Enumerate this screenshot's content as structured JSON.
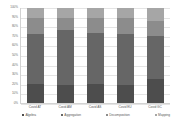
{
  "chart_data": {
    "type": "bar",
    "title": "",
    "subtitle": "",
    "xlabel": "",
    "ylabel": "",
    "stacked": true,
    "percent_stacked": true,
    "grid": true,
    "legend_position": "bottom",
    "ylim": [
      0,
      100
    ],
    "ytick_labels": [
      "100%",
      "90%",
      "80%",
      "70%",
      "60%",
      "50%",
      "40%",
      "30%",
      "20%",
      "10%",
      "0%"
    ],
    "ytick_values": [
      100,
      90,
      80,
      70,
      60,
      50,
      40,
      30,
      20,
      10,
      0
    ],
    "categories": [
      "Covid AT",
      "Covid AM",
      "Covid AS",
      "Covid EU",
      "Covid GC"
    ],
    "series": [
      {
        "name": "Algebra",
        "color": "#4d4d4d",
        "values": [
          20,
          19,
          20,
          19,
          25
        ]
      },
      {
        "name": "Aggregation",
        "color": "#666666",
        "values": [
          53,
          58,
          54,
          54,
          45
        ]
      },
      {
        "name": "Decomposition",
        "color": "#8c8c8c",
        "values": [
          16,
          13,
          15,
          16,
          16
        ]
      },
      {
        "name": "Mapping",
        "color": "#a6a6a6",
        "values": [
          11,
          10,
          11,
          11,
          14
        ]
      }
    ]
  },
  "colors": {
    "background": "#ffffff",
    "grid": "#e4e4e4",
    "axis": "#d2d2d2",
    "tick_text": "#6d6d6d",
    "label_text": "#5a5a5a"
  }
}
